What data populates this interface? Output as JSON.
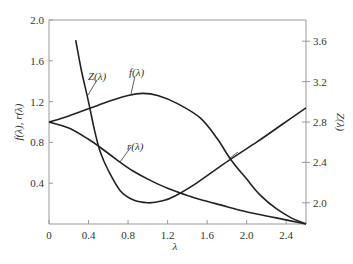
{
  "chart_data": {
    "type": "line",
    "title": "",
    "xlabel": "λ",
    "ylabel": "f(λ), r(λ)",
    "y2label": "Z(λ)",
    "xlim": [
      0,
      2.6
    ],
    "ylim": [
      0,
      2.0
    ],
    "y2lim": [
      1.79,
      3.81
    ],
    "grid": false,
    "legend": "inline labels",
    "x_ticks": [
      "0",
      "0.4",
      "0.8",
      "1.2",
      "1.6",
      "2.0",
      "2.4"
    ],
    "y_ticks": [
      "0.4",
      "0.8",
      "1.2",
      "1.6",
      "2.0"
    ],
    "y2_ticks": [
      "2.0",
      "2.4",
      "2.8",
      "3.2",
      "3.6"
    ],
    "series": [
      {
        "name": "f(λ)",
        "axis": "left",
        "x": [
          0,
          0.2,
          0.4,
          0.6,
          0.8,
          0.95,
          1.1,
          1.3,
          1.53,
          1.7,
          1.84,
          2.0,
          2.14,
          2.3,
          2.45,
          2.6
        ],
        "y": [
          1.0,
          1.06,
          1.13,
          1.2,
          1.26,
          1.28,
          1.26,
          1.18,
          1.04,
          0.84,
          0.63,
          0.44,
          0.28,
          0.15,
          0.06,
          0.0
        ]
      },
      {
        "name": "r(λ)",
        "axis": "left",
        "x": [
          0,
          0.2,
          0.4,
          0.52,
          0.7,
          0.85,
          1.02,
          1.2,
          1.4,
          1.53,
          1.8,
          2.04,
          2.3,
          2.6
        ],
        "y": [
          1.0,
          0.94,
          0.83,
          0.75,
          0.62,
          0.52,
          0.43,
          0.35,
          0.28,
          0.24,
          0.17,
          0.11,
          0.06,
          0.0
        ]
      },
      {
        "name": "Z(λ)",
        "axis": "right",
        "x": [
          0.27,
          0.33,
          0.4,
          0.46,
          0.52,
          0.6,
          0.72,
          0.85,
          1.0,
          1.15,
          1.28,
          1.5,
          1.82,
          2.1,
          2.35,
          2.6
        ],
        "y": [
          3.61,
          3.3,
          3.0,
          2.72,
          2.5,
          2.32,
          2.12,
          2.03,
          2.0,
          2.02,
          2.07,
          2.2,
          2.42,
          2.6,
          2.77,
          2.94
        ]
      }
    ],
    "annotations": [
      {
        "text": "Z(λ)",
        "points_to": "Z curve near λ≈0.4"
      },
      {
        "text": "f(λ)",
        "points_to": "f curve near λ≈0.75"
      },
      {
        "text": "r(λ)",
        "points_to": "r curve near λ≈0.7"
      },
      {
        "text": "",
        "points_to": "leader to Z curve near λ≈1.85"
      }
    ]
  },
  "labels": {
    "xlabel": "λ",
    "ylabel": "f(λ), r(λ)",
    "y2label": "Z(λ)",
    "f": "f(λ)",
    "r": "r(λ)",
    "z": "Z(λ)"
  }
}
